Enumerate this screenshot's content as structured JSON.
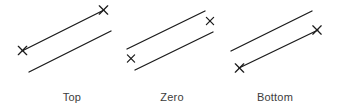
{
  "figure": {
    "title": "",
    "background_color": "#ffffff",
    "line_color": "#1b1b1b",
    "marker_color": "#1b1b1b",
    "caption_color": "#3c3c3c",
    "marker_glyph": "x-mark",
    "groups": [
      {
        "id": "top",
        "label": "Top",
        "label_x": 72,
        "label_y": 101,
        "marker_placement": "top",
        "lines": [
          {
            "name": "upper-line",
            "x1": 22,
            "y1": 51,
            "x2": 104,
            "y2": 10
          },
          {
            "name": "lower-line",
            "x1": 29,
            "y1": 72,
            "x2": 111,
            "y2": 31
          }
        ],
        "markers": [
          {
            "name": "left-x-mark",
            "cx": 22.5,
            "cy": 50.5,
            "size": 4.2
          },
          {
            "name": "right-x-mark",
            "cx": 103.5,
            "cy": 10.0,
            "size": 4.2
          }
        ]
      },
      {
        "id": "zero",
        "label": "Zero",
        "label_x": 172,
        "label_y": 101,
        "marker_placement": "zero",
        "lines": [
          {
            "name": "upper-line",
            "x1": 127,
            "y1": 49,
            "x2": 205,
            "y2": 11
          },
          {
            "name": "lower-line",
            "x1": 135,
            "y1": 70,
            "x2": 213,
            "y2": 32
          }
        ],
        "markers": [
          {
            "name": "left-x-mark",
            "cx": 131.0,
            "cy": 58.5,
            "size": 3.6
          },
          {
            "name": "right-x-mark",
            "cx": 210.0,
            "cy": 21.0,
            "size": 3.6
          }
        ]
      },
      {
        "id": "bottom",
        "label": "Bottom",
        "label_x": 275,
        "label_y": 101,
        "marker_placement": "bottom",
        "lines": [
          {
            "name": "upper-line",
            "x1": 231,
            "y1": 51,
            "x2": 312,
            "y2": 11
          },
          {
            "name": "lower-line",
            "x1": 239,
            "y1": 68,
            "x2": 318,
            "y2": 30
          }
        ],
        "markers": [
          {
            "name": "left-x-mark",
            "cx": 239.5,
            "cy": 68.0,
            "size": 4.2
          },
          {
            "name": "right-x-mark",
            "cx": 317.0,
            "cy": 30.0,
            "size": 4.2
          }
        ]
      }
    ]
  }
}
